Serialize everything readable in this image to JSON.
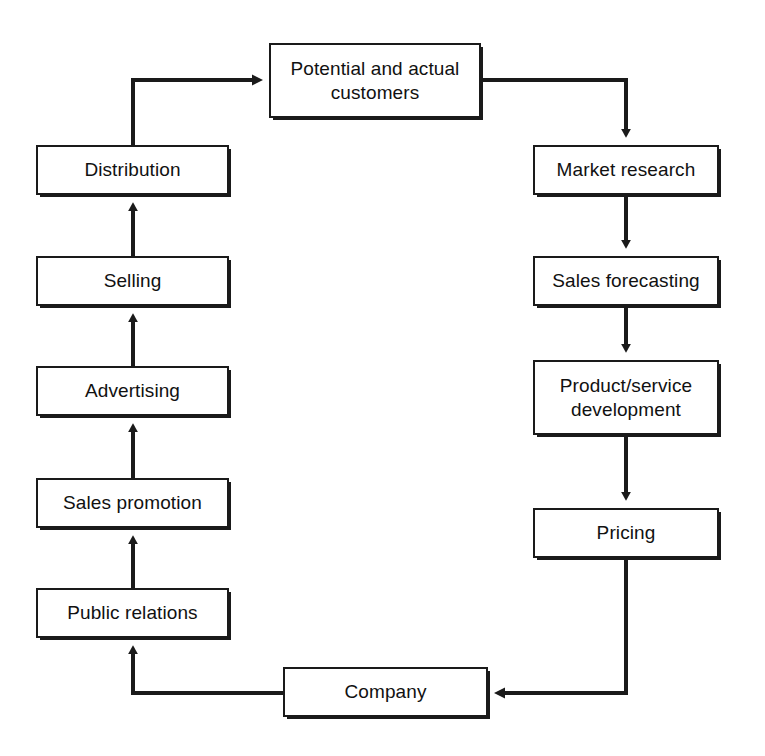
{
  "diagram": {
    "stroke_color": "#1a1a1a",
    "fill_color": "#ffffff",
    "nodes": [
      {
        "id": "customers",
        "label": "Potential and actual\ncustomers"
      },
      {
        "id": "distribution",
        "label": "Distribution"
      },
      {
        "id": "selling",
        "label": "Selling"
      },
      {
        "id": "advertising",
        "label": "Advertising"
      },
      {
        "id": "sales_promotion",
        "label": "Sales promotion"
      },
      {
        "id": "public_relations",
        "label": "Public relations"
      },
      {
        "id": "company",
        "label": "Company"
      },
      {
        "id": "market_research",
        "label": "Market research"
      },
      {
        "id": "sales_forecasting",
        "label": "Sales forecasting"
      },
      {
        "id": "product_service",
        "label": "Product/service\ndevelopment"
      },
      {
        "id": "pricing",
        "label": "Pricing"
      }
    ],
    "edges": [
      {
        "from": "company",
        "to": "public_relations",
        "arrow": "up"
      },
      {
        "from": "public_relations",
        "to": "sales_promotion",
        "arrow": "up"
      },
      {
        "from": "sales_promotion",
        "to": "advertising",
        "arrow": "up"
      },
      {
        "from": "advertising",
        "to": "selling",
        "arrow": "up"
      },
      {
        "from": "selling",
        "to": "distribution",
        "arrow": "up"
      },
      {
        "from": "distribution",
        "to": "customers",
        "arrow": "right"
      },
      {
        "from": "customers",
        "to": "market_research",
        "arrow": "down"
      },
      {
        "from": "market_research",
        "to": "sales_forecasting",
        "arrow": "down"
      },
      {
        "from": "sales_forecasting",
        "to": "product_service",
        "arrow": "down"
      },
      {
        "from": "product_service",
        "to": "pricing",
        "arrow": "down"
      },
      {
        "from": "pricing",
        "to": "company",
        "arrow": "left"
      }
    ]
  }
}
